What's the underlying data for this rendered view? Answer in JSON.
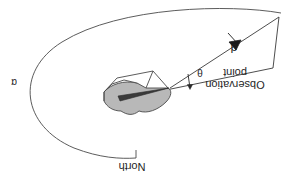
{
  "figure": {
    "type": "technical-geometry-diagram",
    "orientation": "rotated-180-upside-down",
    "background_color": "#ffffff",
    "line_color": "#3a3a3a",
    "terrain_fill_color": "#b8b8b8",
    "terrain_stroke_color": "#4a4a4a"
  },
  "labels": {
    "observation_point": "Observation\npoint",
    "north": "North",
    "distance": "d",
    "elevation_angle": "θ",
    "azimuth_angle": "α"
  },
  "annotations": {
    "distance_symbol": "d",
    "theta_symbol": "θ",
    "alpha_symbol": "α",
    "north_reference": "North",
    "observation_label_line1": "Observation",
    "observation_label_line2": "point"
  },
  "icons": {
    "distance_arrow": "arrow-head-icon",
    "theta_angle_marker": "angle-arrow-icon",
    "azimuth_arc": "arc-icon",
    "north_tick": "tick-mark-icon"
  },
  "geometry": {
    "azimuth_arc_path": "M 281 13 C 230 4 120 6 62 42 C 14 72 22 126 74 148 C 100 158 120 159 136 158",
    "north_tick_path": "M 136 158 L 136 150",
    "sight_line_path": "M 170 88 L 278 18",
    "triangle_lower_path": "M 170 88 L 272 68",
    "triangle_right_path": "M 278 18 L 272 68",
    "arrow_tip": [
      236,
      45
    ],
    "theta_vertex": [
      170,
      88
    ],
    "terrain_blob_path": "M 104 92 L 104 101 C 108 108 118 112 127 110 C 134 114 140 115 146 110 C 156 112 165 106 170 99 C 174 94 172 90 168 88 C 160 84 148 82 138 83 C 126 80 112 84 104 92 Z",
    "box_top_path": "M 104 92 L 116 78 L 152 72 L 168 88",
    "box_edge_vertical": "M 152 72 L 146 88",
    "box_left_vertical": "M 104 92 L 104 101",
    "box_inner_path": "M 116 78 L 126 84",
    "pointer_line_1": "M 120 96 L 170 89",
    "pointer_line_2": "M 121 100 L 170 89"
  }
}
